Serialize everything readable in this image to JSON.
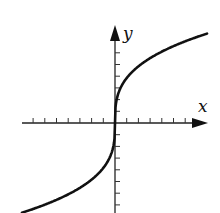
{
  "figure": {
    "axes": {
      "x_label": "x",
      "y_label": "y",
      "origin_px": [
        115,
        123
      ],
      "x_ticks_left": 7,
      "x_ticks_right": 6,
      "y_ticks_up": 6,
      "y_ticks_down": 7,
      "tick_spacing_px": 11.7
    },
    "curve": {
      "function": "cube-root",
      "color": "#111111"
    },
    "colors": {
      "axis": "#222222",
      "background": "#ffffff"
    }
  }
}
